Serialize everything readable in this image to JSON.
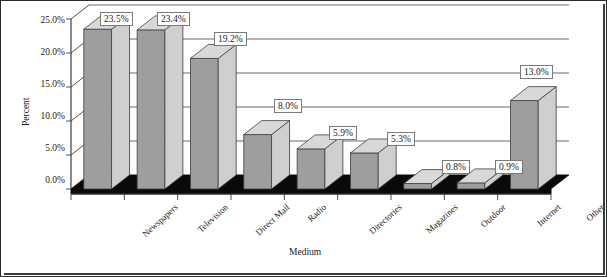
{
  "chart_data": {
    "type": "bar",
    "title": "",
    "xlabel": "Medium",
    "ylabel": "Percent",
    "categories": [
      "Newspapers",
      "Television",
      "Direct Mail",
      "Radio",
      "Directories",
      "Magazines",
      "Outdoor",
      "Internet",
      "Other"
    ],
    "values": [
      23.5,
      23.4,
      19.2,
      8.0,
      5.9,
      5.3,
      0.8,
      0.9,
      13.0
    ],
    "data_labels": [
      "23.5%",
      "23.4%",
      "19.2%",
      "8.0%",
      "5.9%",
      "5.3%",
      "0.8%",
      "0.9%",
      "13.0%"
    ],
    "ylim": [
      0,
      25
    ],
    "ytick_values": [
      0,
      5,
      10,
      15,
      20,
      25
    ],
    "ytick_labels": [
      "0.0%",
      "5.0%",
      "10.0%",
      "15.0%",
      "20.0%",
      "25.0%"
    ],
    "grid": true,
    "legend": "none",
    "style": "3d-column",
    "colors": {
      "bar_front": "#9e9e9e",
      "bar_side": "#cfcfcf",
      "bar_top": "#d8d8d8",
      "bar_outline": "#3d3d3d",
      "floor": "#0a0a0a",
      "gridline": "#5a5a5a",
      "axis": "#3d3d3d",
      "label_box_border": "#7a7a7a",
      "background": "#ffffff",
      "frame": "#2b2b2b"
    }
  }
}
